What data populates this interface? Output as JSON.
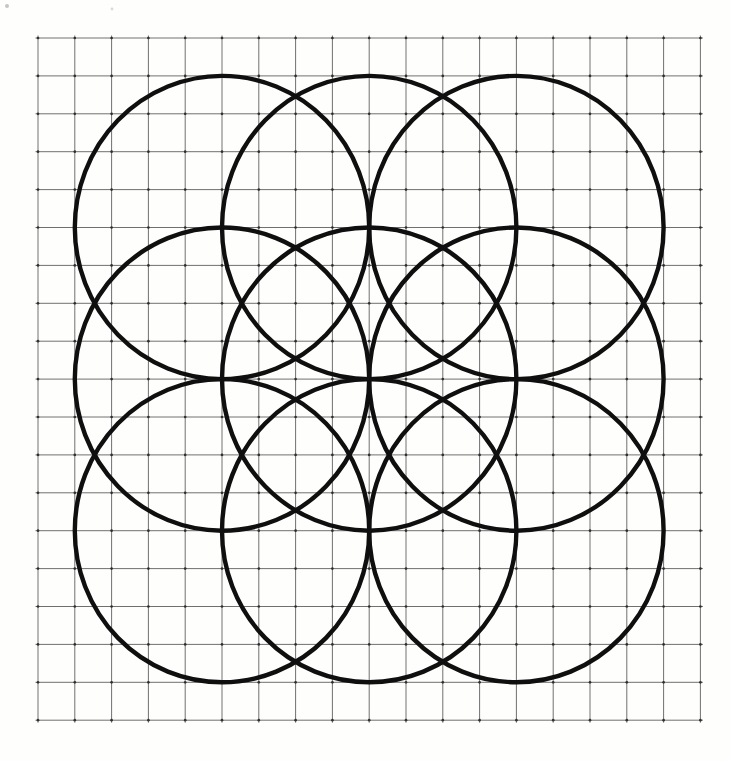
{
  "figure": {
    "name": "nine-overlapping-circles-on-graph-paper",
    "width": 731,
    "height": 761,
    "background": "#fefefc",
    "grid": {
      "origin_x": 38,
      "origin_y": 38,
      "columns": 18,
      "rows": 18,
      "cell_width": 36.8,
      "cell_height": 37.9,
      "line_color": "#585858",
      "line_width": 1,
      "line_opacity": 0.85,
      "line_overshoot": 2.5,
      "node_color": "#272727",
      "node_radius": 1.35,
      "node_opacity": 0.9
    },
    "circles": {
      "stroke_color": "#0f0f0f",
      "stroke_width": 4.4,
      "fill": "none",
      "radius_x_units": 4,
      "radius_y_units": 4,
      "centers_units": [
        [
          5,
          5
        ],
        [
          9,
          5
        ],
        [
          13,
          5
        ],
        [
          5,
          9
        ],
        [
          9,
          9
        ],
        [
          13,
          9
        ],
        [
          5,
          13
        ],
        [
          9,
          13
        ],
        [
          13,
          13
        ]
      ]
    },
    "specks": [
      {
        "x": 7,
        "y": 6,
        "r": 2,
        "color": "#c6c6c6"
      },
      {
        "x": 112,
        "y": 9,
        "r": 1.4,
        "color": "#dadada"
      }
    ]
  }
}
